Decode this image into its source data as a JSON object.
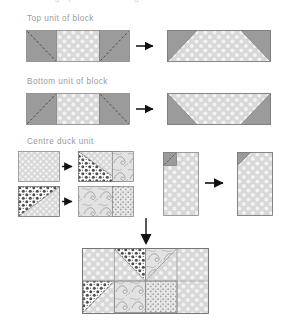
{
  "page": {
    "background": "#ffffff",
    "cropped_top_text": "Making up the block diagram",
    "text_color": "#9a9a9e"
  },
  "palette": {
    "solid_grey": "#9b9b9b",
    "dot_background": "#d8d8d8",
    "dot_color": "#f2f2f2",
    "outline": "#7c7c7c",
    "arrow": "#111111",
    "dashed_line": "#4a4a4a",
    "swirl_light": "#dcdcdc",
    "dark_print": "#5a5a5a",
    "speckle": "#c9c9c9"
  },
  "sections": [
    {
      "id": "top-unit",
      "label": "Top unit of block",
      "steps": [
        {
          "name": "top-unit-pieces",
          "description": "Two solid grey squares with dashed sewing lines flanking a polka dot rectangle"
        },
        {
          "name": "top-unit-result",
          "description": "Pieced trapezoid, polka dot centre widening downward with grey corner triangles at the top"
        }
      ],
      "arrow": "arrow-right"
    },
    {
      "id": "bottom-unit",
      "label": "Bottom unit of block",
      "steps": [
        {
          "name": "bottom-unit-pieces",
          "description": "Two solid grey squares with reversed dashed sewing lines flanking a polka dot rectangle"
        },
        {
          "name": "bottom-unit-result",
          "description": "Pieced trapezoid, polka dot centre narrowing downward with grey corner triangles at the bottom"
        }
      ],
      "arrow": "arrow-right"
    },
    {
      "id": "centre-duck-unit",
      "label": "Centre duck unit",
      "rows": [
        {
          "name": "duck-row-one",
          "cells": [
            "polka dot square",
            "dark print triangle joined to polka dot square",
            "trimmed narrow swirl print rectangle"
          ]
        },
        {
          "name": "duck-row-two",
          "cells": [
            "polka dot square with dark print triangle in the upper left",
            "swirl print square",
            "trimmed narrow speckled rectangle"
          ]
        }
      ],
      "side_steps": [
        {
          "name": "centre-column-pieces",
          "description": "Tall polka dot rectangle with small grey corner square and dashed line at the top left"
        },
        {
          "name": "centre-column-result",
          "description": "Tall polka dot rectangle with sewn grey corner triangle at the top left"
        }
      ],
      "arrows": [
        "arrow-right",
        "arrow-right",
        "arrow-right",
        "arrow-right",
        "arrow-right"
      ]
    },
    {
      "id": "finished-block",
      "label": "",
      "arrow": "arrow-down",
      "description": "Completed block: polka dot ground with dark print and swirl print triangles forming the duck motif"
    }
  ]
}
